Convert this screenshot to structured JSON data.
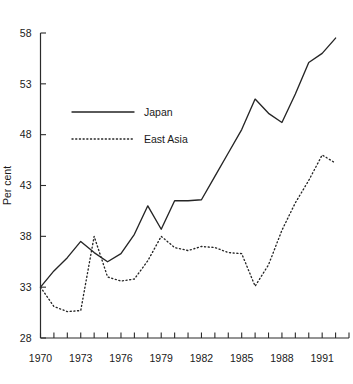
{
  "chart_data": {
    "type": "line",
    "title": "",
    "xlabel": "",
    "ylabel": "Per cent",
    "xlim": [
      1970,
      1993
    ],
    "ylim": [
      28,
      58
    ],
    "grid": false,
    "legend_position": "upper-left-inside",
    "y_ticks": [
      28,
      33,
      38,
      43,
      48,
      53,
      58
    ],
    "y_tick_labels": [
      "28",
      "33",
      "38",
      "43",
      "48",
      "53",
      "58"
    ],
    "x_ticks": [
      1970,
      1971,
      1972,
      1973,
      1974,
      1975,
      1976,
      1977,
      1978,
      1979,
      1980,
      1981,
      1982,
      1983,
      1984,
      1985,
      1986,
      1987,
      1988,
      1989,
      1990,
      1991,
      1992,
      1993
    ],
    "x_tick_labels_shown": [
      "1970",
      "1973",
      "1976",
      "1979",
      "1982",
      "1985",
      "1988",
      "1991"
    ],
    "x_tick_labels_shown_years": [
      1970,
      1973,
      1976,
      1979,
      1982,
      1985,
      1988,
      1991
    ],
    "x": [
      1970,
      1971,
      1972,
      1973,
      1974,
      1975,
      1976,
      1977,
      1978,
      1979,
      1980,
      1981,
      1982,
      1983,
      1984,
      1985,
      1986,
      1987,
      1988,
      1989,
      1990,
      1991,
      1992
    ],
    "series": [
      {
        "name": "Japan",
        "style": "solid",
        "color": "#252525",
        "values": [
          33.0,
          34.6,
          35.9,
          37.5,
          36.4,
          35.5,
          36.3,
          38.2,
          41.0,
          38.7,
          41.5,
          41.5,
          41.6,
          43.9,
          46.2,
          48.5,
          51.5,
          50.1,
          49.2,
          52.0,
          55.1,
          56.0,
          57.5
        ]
      },
      {
        "name": "East Asia",
        "style": "dotted",
        "color": "#252525",
        "values": [
          33.0,
          31.1,
          30.6,
          30.7,
          38.0,
          34.0,
          33.6,
          33.8,
          35.6,
          38.0,
          36.9,
          36.6,
          37.0,
          36.9,
          36.4,
          36.3,
          33.1,
          35.2,
          38.6,
          41.3,
          43.5,
          46.0,
          45.2
        ]
      }
    ]
  },
  "legend": {
    "entries": [
      {
        "label": "Japan",
        "style": "solid"
      },
      {
        "label": "East Asia",
        "style": "dotted"
      }
    ]
  }
}
